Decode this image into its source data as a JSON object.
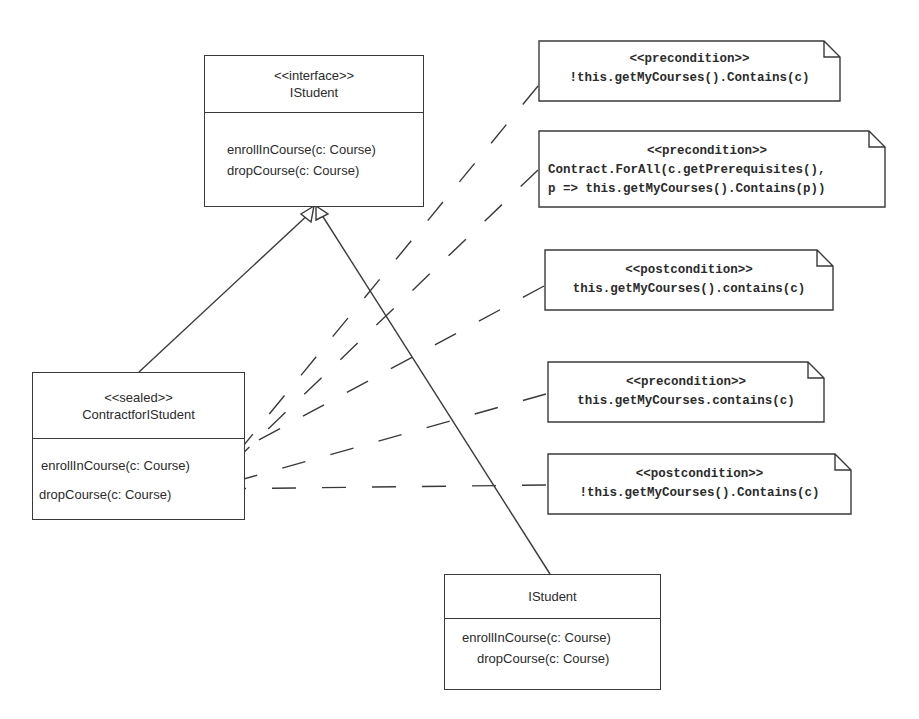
{
  "diagram": {
    "type": "UML class diagram with contract notes",
    "stroke_color": "#3a3a3a",
    "text_color": "#2b2b2b",
    "background": "#ffffff"
  },
  "interface_box": {
    "stereotype": "<<interface>>",
    "name": "IStudent",
    "operations": [
      "enrollInCourse(c: Course)",
      "dropCourse(c: Course)"
    ]
  },
  "sealed_box": {
    "stereotype": "<<sealed>>",
    "name": "ContractforIStudent",
    "operations": [
      "enrollInCourse(c: Course)",
      "dropCourse(c: Course)"
    ]
  },
  "impl_box": {
    "name": "IStudent",
    "operations": [
      "enrollInCourse(c: Course)",
      "dropCourse(c: Course)"
    ]
  },
  "notes": [
    {
      "stereotype": "<<precondition>>",
      "lines": [
        "!this.getMyCourses().Contains(c)"
      ]
    },
    {
      "stereotype": "<<precondition>>",
      "lines": [
        "Contract.ForAll(c.getPrerequisites(),",
        "p => this.getMyCourses().Contains(p))"
      ]
    },
    {
      "stereotype": "<<postcondition>>",
      "lines": [
        "this.getMyCourses().contains(c)"
      ]
    },
    {
      "stereotype": "<<precondition>>",
      "lines": [
        "this.getMyCourses.contains(c)"
      ]
    },
    {
      "stereotype": "<<postcondition>>",
      "lines": [
        "!this.getMyCourses().Contains(c)"
      ]
    }
  ]
}
